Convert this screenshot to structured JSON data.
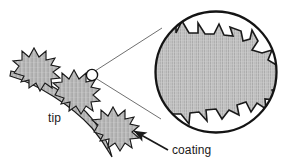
{
  "figure": {
    "kind": "scientific-line-drawing",
    "caption_labels": {
      "tip": "tip",
      "coating": "coating"
    },
    "colors": {
      "ink": "#1a1a1a",
      "fill_gray": "#b9b9b9",
      "fill_gray_light": "#cfcfcf",
      "background": "#ffffff",
      "leader_line": "#4a4a4a"
    },
    "magnifier": {
      "circle_center_x": 216,
      "circle_center_y": 72,
      "circle_radius": 61,
      "circle_stroke_width": 2.2,
      "source_marker_center_x": 92,
      "source_marker_center_y": 75,
      "source_marker_radius": 5.5,
      "leader_upper": "92,71 to 160,30",
      "leader_lower": "95,79 to 160,120"
    },
    "substrate": {
      "description": "curved tapering band representing the probe tip",
      "start": "10,78",
      "end": "112,156"
    },
    "coating_blobs": [
      {
        "name": "blob-upper-left",
        "cx": 38,
        "cy": 62,
        "r": 20,
        "spikes": 11
      },
      {
        "name": "blob-middle",
        "cx": 78,
        "cy": 86,
        "r": 20,
        "spikes": 11
      },
      {
        "name": "blob-lower-right",
        "cx": 116,
        "cy": 124,
        "r": 19,
        "spikes": 11
      }
    ],
    "arrow": {
      "name": "coating-arrow",
      "from_x": 168,
      "from_y": 150,
      "to_x": 133,
      "to_y": 131
    },
    "label_positions": {
      "tip": {
        "x": 48,
        "y": 122
      },
      "coating": {
        "x": 172,
        "y": 153
      }
    }
  }
}
